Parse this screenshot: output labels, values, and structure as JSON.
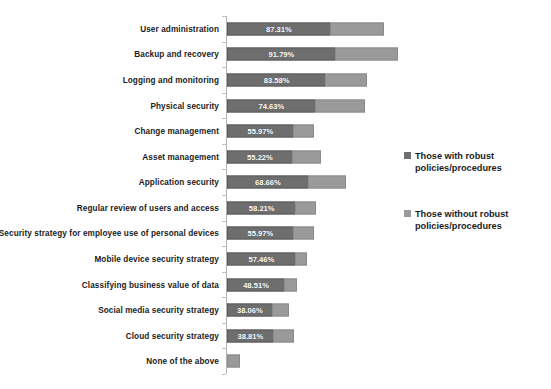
{
  "chart_data": {
    "type": "bar",
    "subtype": "stacked-horizontal",
    "title": "",
    "subtitle": "",
    "xlabel": "",
    "ylabel": "",
    "grid": false,
    "axis": {
      "x_visible": false,
      "y_visible": true,
      "y_ticks_visible": true
    },
    "xlim": [
      0,
      145.36
    ],
    "legend_position": "right",
    "value_suffix": "%",
    "categories": [
      "User administration",
      "Backup and recovery",
      "Logging and monitoring",
      "Physical security",
      "Change management",
      "Asset management",
      "Application security",
      "Regular review of users and access",
      "Security strategy for employee use of personal devices",
      "Mobile device security strategy",
      "Classifying business value of data",
      "Social media security strategy",
      "Cloud security strategy",
      "None of the above"
    ],
    "series": [
      {
        "name": "Those with robust policies/procedures",
        "color": "#6e6e6e",
        "labels": [
          "87.31%",
          "91.79%",
          "83.58%",
          "74.63%",
          "55.97%",
          "55.22%",
          "68.66%",
          "58.21%",
          "55.97%",
          "57.46%",
          "48.51%",
          "38.06%",
          "38.81%",
          ""
        ],
        "values": [
          87.31,
          91.79,
          83.58,
          74.63,
          55.97,
          55.22,
          68.66,
          58.21,
          55.97,
          57.46,
          48.51,
          38.06,
          38.81,
          0
        ]
      },
      {
        "name": "Those without robust policies/procedures",
        "color": "#9a9a9a",
        "labels": [
          "46.43%",
          "53.57%",
          "35.71%",
          "42.86%",
          "17.86%",
          "25.00%",
          "32.14%",
          "17.86%",
          "17.86%",
          "10.71%",
          "10.71%",
          "14.29%",
          "17.86%",
          "10.71%"
        ],
        "values": [
          46.43,
          53.57,
          35.71,
          42.86,
          17.86,
          25.0,
          32.14,
          17.86,
          17.86,
          10.71,
          10.71,
          14.29,
          17.86,
          10.71
        ]
      }
    ]
  },
  "legend": {
    "items": [
      {
        "label": "Those with robust policies/procedures",
        "color": "#6e6e6e",
        "icon": "square-swatch-icon"
      },
      {
        "label": "Those without robust policies/procedures",
        "color": "#9a9a9a",
        "icon": "square-swatch-icon"
      }
    ]
  },
  "colors": {
    "series_with": "#6e6e6e",
    "series_without": "#9a9a9a",
    "axis": "#b3b3b3",
    "text": "#1c1c1c",
    "background": "#ffffff"
  }
}
